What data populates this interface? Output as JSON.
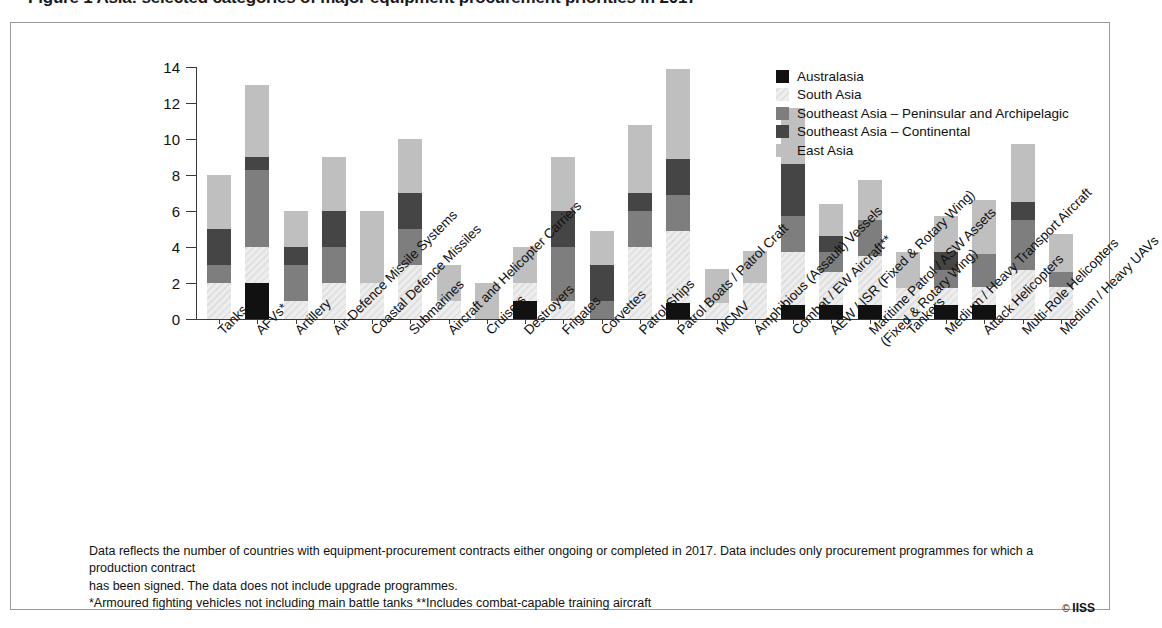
{
  "title": "Figure 1  Asia: selected categories of major equipment procurement priorities in 2017",
  "credit": "IISS",
  "credit_symbol": "©",
  "footnote_lines": [
    "Data reflects the number of countries with equipment-procurement contracts either ongoing or completed in 2017. Data includes only procurement programmes for which a production contract",
    "has been signed. The data does not include upgrade programmes.",
    "*Armoured fighting vehicles not including main battle tanks  **Includes combat-capable training aircraft"
  ],
  "legend": {
    "position": "top-right",
    "items": [
      {
        "label": "Australasia",
        "color": "#111111"
      },
      {
        "label": "South Asia",
        "color": "#ededed"
      },
      {
        "label": "Southeast Asia – Peninsular and Archipelagic",
        "color": "#7e7e7e"
      },
      {
        "label": "Southeast Asia – Continental",
        "color": "#454545"
      },
      {
        "label": "East Asia",
        "color": "#bfbfbf"
      }
    ]
  },
  "chart_data": {
    "type": "bar",
    "stacked": true,
    "title": "Figure 1  Asia: selected categories of major equipment procurement priorities in 2017",
    "xlabel": "",
    "ylabel": "Number of Countries\nPurchasing",
    "ylim": [
      0,
      14
    ],
    "yticks": [
      0,
      2,
      4,
      6,
      8,
      10,
      12,
      14
    ],
    "grid": false,
    "legend_position": "top-right",
    "categories": [
      "Tanks",
      "AFVs*",
      "Artillery",
      "Air-Defence Missile Systems",
      "Coastal Defence Missiles",
      "Submarines",
      "Aircraft and Helicopter Carriers",
      "Cruisers",
      "Destroyers",
      "Frigates",
      "Corvettes",
      "Patrol Ships",
      "Patrol Boats / Patrol Craft",
      "MCMV",
      "Amphibious (Assault) Vessels",
      "Combat / EW Aircraft**",
      "AEW / ISR (Fixed & Rotary Wing)",
      "Maritime Patrol / ASW Assets\n(Fixed & Rotary Wing)",
      "Tankers",
      "Medium / Heavy Transport Aircraft",
      "Attack Helicopters",
      "Multi-Role Helicopters",
      "Medium / Heavy UAVs"
    ],
    "series": [
      {
        "name": "Australasia",
        "color": "#111111",
        "values": [
          0,
          2,
          0,
          0,
          0,
          0,
          0,
          0,
          1,
          0,
          0,
          0,
          0.9,
          0,
          0,
          0.8,
          0.8,
          0.8,
          0,
          0.8,
          0.8,
          0,
          0
        ]
      },
      {
        "name": "South Asia",
        "color": "#ededed",
        "values": [
          2,
          2,
          1,
          2,
          2,
          3,
          1,
          0,
          1,
          1,
          0,
          4,
          4,
          0.9,
          2,
          2.9,
          1.8,
          2.7,
          1.7,
          0.9,
          1,
          2.7,
          1.8
        ]
      },
      {
        "name": "Southeast Asia – Peninsular and Archipelagic",
        "color": "#7e7e7e",
        "values": [
          1,
          4.3,
          2,
          2,
          0,
          2,
          0,
          0,
          0,
          3,
          1,
          2,
          2,
          0,
          0,
          2,
          1.1,
          2,
          0,
          1,
          1.8,
          2.8,
          0.8
        ]
      },
      {
        "name": "Southeast Asia – Continental",
        "color": "#454545",
        "values": [
          2,
          0.7,
          1,
          2,
          0,
          2,
          0,
          0,
          0,
          2,
          2,
          1,
          2,
          0,
          0,
          2.9,
          0.9,
          0,
          0,
          1,
          0,
          1,
          0
        ]
      },
      {
        "name": "East Asia",
        "color": "#bfbfbf",
        "values": [
          3,
          4,
          2,
          3,
          4,
          3,
          2,
          2,
          2,
          3,
          1.9,
          3.8,
          5,
          1.9,
          1.8,
          3.1,
          1.8,
          2.2,
          2,
          2,
          3,
          3.2,
          2.1
        ]
      }
    ],
    "totals": [
      8,
      13,
      6,
      9,
      6,
      10,
      3,
      2,
      4,
      9,
      4.9,
      10.8,
      13.9,
      2.8,
      3.8,
      10.8,
      5.7,
      7.7,
      3.7,
      5.7,
      6.6,
      9.7,
      4.7
    ]
  }
}
